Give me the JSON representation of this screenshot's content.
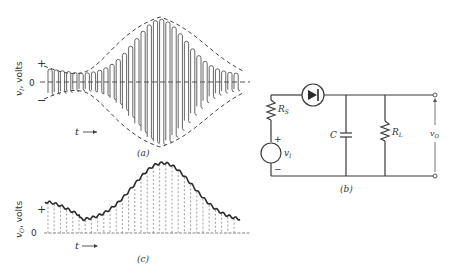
{
  "figure": {
    "panels": [
      {
        "id": "a",
        "caption": "(a)",
        "title": "AM input waveform",
        "y_axis_label": "v_I, volts",
        "y_axis_label_main": "v",
        "y_axis_label_sub": "I",
        "y_axis_label_unit": ", volts",
        "plus_label": "+",
        "zero_label": "0",
        "minus_label": "−",
        "time_label": "t",
        "time_arrow": "→"
      },
      {
        "id": "b",
        "caption": "(b)",
        "title": "Envelope detector circuit",
        "components": {
          "diode": "diode",
          "source_resistor": {
            "main": "R",
            "sub": "S"
          },
          "capacitor": "C",
          "load_resistor": {
            "main": "R",
            "sub": "L"
          },
          "source": {
            "main": "v",
            "sub": "I",
            "plus": "+",
            "minus": "−"
          },
          "output": {
            "main": "v",
            "sub": "O"
          }
        }
      },
      {
        "id": "c",
        "caption": "(c)",
        "title": "Detected output waveform",
        "y_axis_label_main": "v",
        "y_axis_label_sub": "O",
        "y_axis_label_unit": ", volts",
        "plus_label": "+",
        "zero_label": "0",
        "time_label": "t",
        "time_arrow": "→"
      }
    ]
  }
}
